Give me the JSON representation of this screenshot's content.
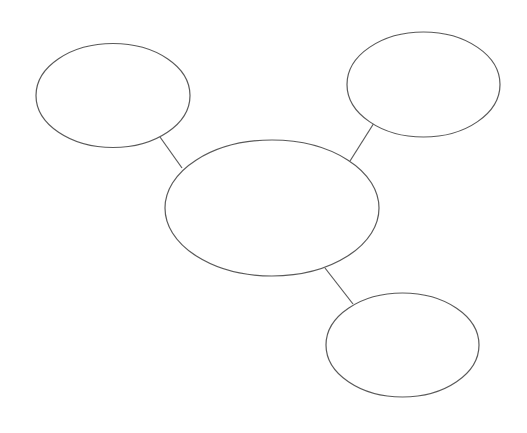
{
  "diagram": {
    "type": "bubble-map",
    "background": "#ffffff",
    "stroke_color": "#5a5a5a",
    "nodes": [
      {
        "id": "top-left",
        "label": "",
        "cx": 113,
        "cy": 95.5,
        "rx": 77,
        "ry": 52
      },
      {
        "id": "top-right",
        "label": "",
        "cx": 423.5,
        "cy": 84.5,
        "rx": 76.5,
        "ry": 52.5
      },
      {
        "id": "center",
        "label": "",
        "cx": 272,
        "cy": 208,
        "rx": 107,
        "ry": 68
      },
      {
        "id": "bottom-right",
        "label": "",
        "cx": 402.5,
        "cy": 345,
        "rx": 76.5,
        "ry": 52
      }
    ],
    "edges": [
      {
        "from": "top-left",
        "to": "center",
        "x1": 160,
        "y1": 137,
        "x2": 182,
        "y2": 168
      },
      {
        "from": "top-right",
        "to": "center",
        "x1": 374,
        "y1": 123,
        "x2": 350,
        "y2": 161
      },
      {
        "from": "center",
        "to": "bottom-right",
        "x1": 325,
        "y1": 268,
        "x2": 353,
        "y2": 304
      }
    ]
  }
}
